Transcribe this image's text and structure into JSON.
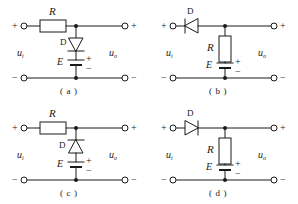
{
  "figure": {
    "background_color": "#ffffff",
    "line_color": "#1a1a1a",
    "panels": [
      {
        "caption": "( a )",
        "series_element": {
          "type": "resistor",
          "label": "R"
        },
        "shunt_element": {
          "type": "diode",
          "label": "D",
          "orientation": "down"
        },
        "source": {
          "label": "E",
          "plus": "+",
          "minus": "−"
        },
        "input_label": {
          "base": "u",
          "sub": "i"
        },
        "output_label": {
          "base": "u",
          "sub": "o"
        },
        "terminals": {
          "in_plus": "+",
          "in_minus": "−",
          "out_plus": "+",
          "out_minus": "−"
        }
      },
      {
        "caption": "( b )",
        "series_element": {
          "type": "diode",
          "label": "D",
          "orientation": "left"
        },
        "shunt_element": {
          "type": "resistor",
          "label": "R"
        },
        "source": {
          "label": "E",
          "plus": "+",
          "minus": "−"
        },
        "input_label": {
          "base": "u",
          "sub": "i"
        },
        "output_label": {
          "base": "u",
          "sub": "o"
        },
        "terminals": {
          "in_plus": "+",
          "in_minus": "−",
          "out_plus": "+",
          "out_minus": "−"
        }
      },
      {
        "caption": "( c )",
        "series_element": {
          "type": "resistor",
          "label": "R"
        },
        "shunt_element": {
          "type": "diode",
          "label": "D",
          "orientation": "up"
        },
        "source": {
          "label": "E",
          "plus": "+",
          "minus": "−"
        },
        "input_label": {
          "base": "u",
          "sub": "i"
        },
        "output_label": {
          "base": "u",
          "sub": "o"
        },
        "terminals": {
          "in_plus": "+",
          "in_minus": "−",
          "out_plus": "+",
          "out_minus": "−"
        }
      },
      {
        "caption": "( d )",
        "series_element": {
          "type": "diode",
          "label": "D",
          "orientation": "right"
        },
        "shunt_element": {
          "type": "resistor",
          "label": "R"
        },
        "source": {
          "label": "E",
          "plus": "+",
          "minus": "−"
        },
        "input_label": {
          "base": "u",
          "sub": "i"
        },
        "output_label": {
          "base": "u",
          "sub": "o"
        },
        "terminals": {
          "in_plus": "+",
          "in_minus": "−",
          "out_plus": "+",
          "out_minus": "−"
        }
      }
    ]
  }
}
